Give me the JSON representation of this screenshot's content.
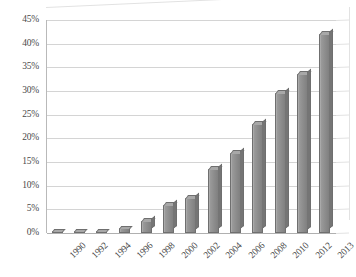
{
  "chart_data": {
    "type": "bar",
    "title": "",
    "subtitle": "",
    "xlabel": "",
    "ylabel": "",
    "categories": [
      "1990",
      "1992",
      "1994",
      "1996",
      "1998",
      "2000",
      "2002",
      "2004",
      "2006",
      "2008",
      "2010",
      "2012",
      "2013"
    ],
    "values": [
      0.3,
      0.4,
      0.5,
      1.0,
      2.5,
      6.0,
      7.5,
      13.5,
      17.0,
      23.0,
      29.5,
      33.7,
      42.0
    ],
    "value_unit": "%",
    "ylim": [
      0,
      45
    ],
    "ytick_step": 5,
    "ytick_labels": [
      "0%",
      "5%",
      "10%",
      "15%",
      "20%",
      "25%",
      "30%",
      "35%",
      "40%",
      "45%"
    ],
    "ytick_values": [
      0,
      5,
      10,
      15,
      20,
      25,
      30,
      35,
      40,
      45
    ],
    "grid": true,
    "grid_axis": "y",
    "legend": false,
    "legend_position": "none",
    "style_3d": true,
    "bar_color": "#8d8d8d",
    "bar_edge_color": "#6f6f6f",
    "gridline_color": "#d4d4d4",
    "axis_color": "#b9b9b9",
    "background_color": "#ffffff",
    "tick_label_color": "#4a4a4a",
    "xtick_label_rotation": -45
  }
}
